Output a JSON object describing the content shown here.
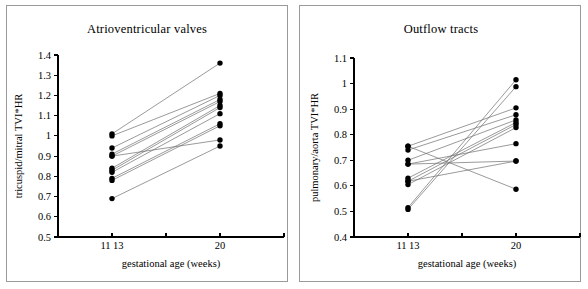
{
  "figure": {
    "panel_count": 2,
    "background_color": "#ffffff",
    "frame_color": "#9a9a9a",
    "point_color": "#000000",
    "line_color": "#6f6f6f"
  },
  "chart_data": [
    {
      "type": "line",
      "panel": "left",
      "title": "Atrioventricular valves",
      "xlabel": "gestational age (weeks)",
      "ylabel": "tricuspid/mitral TVI*HR",
      "xlim": [
        0,
        3
      ],
      "ylim": [
        0.5,
        1.4
      ],
      "ytick_labels": [
        "1.4",
        "1.3",
        "1.2",
        "1.1",
        "1",
        "0.9",
        "0.8",
        "0.7",
        "0.6",
        "0.5"
      ],
      "ytick_values": [
        1.4,
        1.3,
        1.2,
        1.1,
        1.0,
        0.9,
        0.8,
        0.7,
        0.6,
        0.5
      ],
      "xtick_labels": [
        "11 13",
        "",
        "20"
      ],
      "xtick_values": [
        1,
        2,
        3
      ],
      "x": [
        1,
        3
      ],
      "grid": false,
      "legend": "none",
      "series": [
        {
          "name": "subject-01",
          "values": [
            1.01,
            1.36
          ]
        },
        {
          "name": "subject-02",
          "values": [
            1.0,
            1.21
          ]
        },
        {
          "name": "subject-03",
          "values": [
            0.94,
            1.2
          ]
        },
        {
          "name": "subject-04",
          "values": [
            0.91,
            1.18
          ]
        },
        {
          "name": "subject-05",
          "values": [
            0.9,
            1.17
          ]
        },
        {
          "name": "subject-06",
          "values": [
            0.84,
            1.15
          ]
        },
        {
          "name": "subject-07",
          "values": [
            0.83,
            1.14
          ]
        },
        {
          "name": "subject-08",
          "values": [
            0.82,
            1.11
          ]
        },
        {
          "name": "subject-09",
          "values": [
            0.79,
            1.06
          ]
        },
        {
          "name": "subject-10",
          "values": [
            0.78,
            1.05
          ]
        },
        {
          "name": "subject-11",
          "values": [
            0.9,
            0.98
          ]
        },
        {
          "name": "subject-12",
          "values": [
            0.69,
            0.95
          ]
        }
      ]
    },
    {
      "type": "line",
      "panel": "right",
      "title": "Outflow tracts",
      "xlabel": "gestational age (weeks)",
      "ylabel": "pulmonary/aorta TVI*HR",
      "xlim": [
        0,
        3
      ],
      "ylim": [
        0.4,
        1.1
      ],
      "ytick_labels": [
        "1.1",
        "1",
        "0.9",
        "0.8",
        "0.7",
        "0.6",
        "0.5",
        "0.4"
      ],
      "ytick_values": [
        1.1,
        1.0,
        0.9,
        0.8,
        0.7,
        0.6,
        0.5,
        0.4
      ],
      "xtick_labels": [
        "11 13",
        "",
        "20"
      ],
      "xtick_values": [
        1,
        2,
        3
      ],
      "x": [
        1,
        3
      ],
      "grid": false,
      "legend": "none",
      "series": [
        {
          "name": "subject-01",
          "values": [
            0.515,
            1.015
          ]
        },
        {
          "name": "subject-02",
          "values": [
            0.508,
            0.988
          ]
        },
        {
          "name": "subject-03",
          "values": [
            0.755,
            0.905
          ]
        },
        {
          "name": "subject-04",
          "values": [
            0.74,
            0.878
          ]
        },
        {
          "name": "subject-05",
          "values": [
            0.7,
            0.858
          ]
        },
        {
          "name": "subject-06",
          "values": [
            0.63,
            0.848
          ]
        },
        {
          "name": "subject-07",
          "values": [
            0.618,
            0.84
          ]
        },
        {
          "name": "subject-08",
          "values": [
            0.605,
            0.828
          ]
        },
        {
          "name": "subject-09",
          "values": [
            0.685,
            0.765
          ]
        },
        {
          "name": "subject-10",
          "values": [
            0.618,
            0.697
          ]
        },
        {
          "name": "subject-11",
          "values": [
            0.685,
            0.697
          ]
        },
        {
          "name": "subject-12",
          "values": [
            0.755,
            0.587
          ]
        }
      ]
    }
  ]
}
